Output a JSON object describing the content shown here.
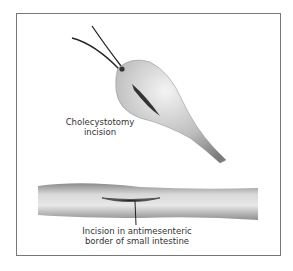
{
  "figure": {
    "labels": {
      "gallbladder": [
        "Cholecystotomy",
        "incision"
      ],
      "intestine": [
        "Incision in antimesenteric",
        "border of small intestine"
      ]
    }
  }
}
